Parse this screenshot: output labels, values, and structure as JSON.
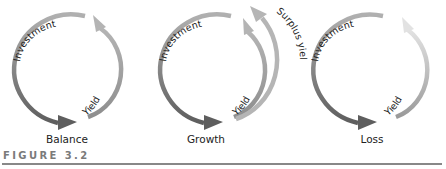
{
  "figure": {
    "label": "FIGURE 3.2",
    "panels": [
      {
        "id": "balance",
        "caption": "Balance",
        "arrows": [
          {
            "label": "Investment",
            "color": "#6b6b6b"
          },
          {
            "label": "Yield",
            "color": "#a8a8a8"
          }
        ]
      },
      {
        "id": "growth",
        "caption": "Growth",
        "arrows": [
          {
            "label": "Investment",
            "color": "#6b6b6b"
          },
          {
            "label": "Yield",
            "color": "#a8a8a8"
          },
          {
            "label": "Surplus yield",
            "color": "#b5b5b5"
          }
        ]
      },
      {
        "id": "loss",
        "caption": "Loss",
        "arrows": [
          {
            "label": "Investment",
            "color": "#6b6b6b"
          },
          {
            "label": "Yield",
            "color": "#c8c8c8"
          }
        ]
      }
    ]
  },
  "colors": {
    "investment": "#6b6b6b",
    "yield": "#a8a8a8",
    "yield_faded": "#d6d6d6",
    "surplus": "#b5b5b5",
    "label": "#7a7a7a",
    "rule": "#888888"
  }
}
